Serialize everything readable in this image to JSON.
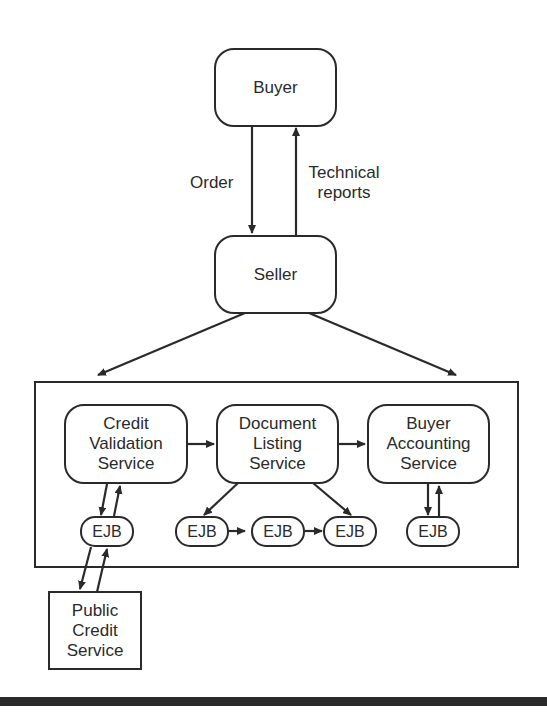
{
  "diagram": {
    "nodes": {
      "buyer": {
        "label": "Buyer"
      },
      "seller": {
        "label": "Seller"
      },
      "credit_validation": {
        "lines": [
          "Credit",
          "Validation",
          "Service"
        ]
      },
      "document_listing": {
        "lines": [
          "Document",
          "Listing",
          "Service"
        ]
      },
      "buyer_accounting": {
        "lines": [
          "Buyer",
          "Accounting",
          "Service"
        ]
      },
      "public_credit": {
        "lines": [
          "Public",
          "Credit",
          "Service"
        ]
      },
      "ejbs": [
        {
          "label": "EJB"
        },
        {
          "label": "EJB"
        },
        {
          "label": "EJB"
        },
        {
          "label": "EJB"
        },
        {
          "label": "EJB"
        }
      ]
    },
    "edges": {
      "order": {
        "label": "Order"
      },
      "technical_reports": {
        "lines": [
          "Technical",
          "reports"
        ]
      }
    }
  }
}
